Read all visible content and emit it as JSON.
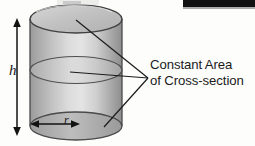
{
  "figure": {
    "type": "cylinder-cross-section-diagram",
    "title": "",
    "shape": {
      "name": "cylinder",
      "fill_light": "#e9e9e9",
      "fill_mid": "#b4b4b4",
      "fill_dark": "#8f8f8f",
      "outline_color": "#3a3a3a",
      "top_ellipse_fill": "#c9c9c9",
      "bottom_ellipse_fill": "#a6a6a6",
      "cross_section_fill": "#cfcfcf"
    },
    "dimension_labels": {
      "height": "h",
      "radius": "r"
    },
    "annotation": {
      "line1": "Constant Area",
      "line2": "of Cross-section",
      "text_color": "#1b1b1b",
      "leader_count": 3
    },
    "artifacts": {
      "scan_bar_color": "#111111",
      "background_color": "#fdfdfc"
    }
  }
}
